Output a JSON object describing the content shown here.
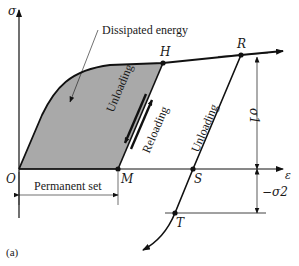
{
  "figure": {
    "panel_label": "(a)",
    "axes": {
      "y_label": "σ",
      "x_label": "ε"
    },
    "annotations": {
      "dissipated_energy": "Dissipated energy",
      "permanent_set": "Permanent set",
      "unloading_1": "Unloading",
      "reloading": "Reloading",
      "unloading_2": "Unloading",
      "sigma1": "σ1",
      "sigma2": "−σ2"
    },
    "points": {
      "O": "O",
      "M": "M",
      "H": "H",
      "R": "R",
      "S": "S",
      "T": "T"
    },
    "colors": {
      "shaded_region": "#a9a9a9",
      "line": "#111111"
    }
  }
}
